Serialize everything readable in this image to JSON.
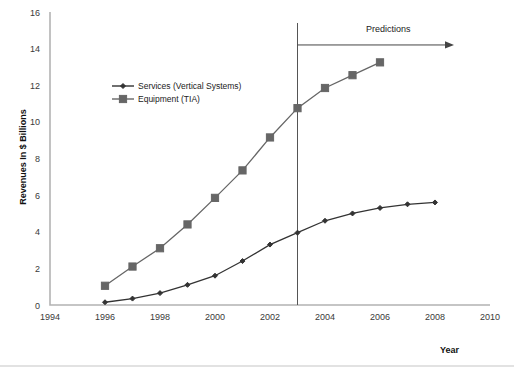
{
  "chart_data": {
    "type": "line",
    "title": "",
    "xlabel": "Year",
    "ylabel": "Revenues In $ Billions",
    "xlim": [
      1994,
      2010
    ],
    "ylim": [
      0,
      16
    ],
    "xticks": [
      1994,
      1996,
      1998,
      2000,
      2002,
      2004,
      2006,
      2008,
      2010
    ],
    "yticks": [
      0,
      2,
      4,
      6,
      8,
      10,
      12,
      14,
      16
    ],
    "grid": false,
    "legend_position": "upper-left-inside",
    "series": [
      {
        "name": "Services (Vertical Systems)",
        "marker": "diamond",
        "color": "#333333",
        "x": [
          1996,
          1997,
          1998,
          1999,
          2000,
          2001,
          2002,
          2003,
          2004,
          2005,
          2006,
          2007,
          2008
        ],
        "values": [
          0.15,
          0.35,
          0.65,
          1.1,
          1.6,
          2.4,
          3.3,
          3.95,
          4.6,
          5.0,
          5.3,
          5.5,
          5.6
        ]
      },
      {
        "name": "Equipment (TIA)",
        "marker": "square",
        "color": "#666666",
        "x": [
          1996,
          1997,
          1998,
          1999,
          2000,
          2001,
          2002,
          2003,
          2004,
          2005,
          2006
        ],
        "values": [
          1.05,
          2.1,
          3.1,
          4.4,
          5.85,
          7.35,
          9.15,
          10.75,
          11.85,
          12.55,
          13.25
        ]
      }
    ],
    "annotations": [
      {
        "text": "Predictions",
        "x": 2006.3,
        "y": 14.9,
        "divider_x": 2003
      }
    ]
  }
}
